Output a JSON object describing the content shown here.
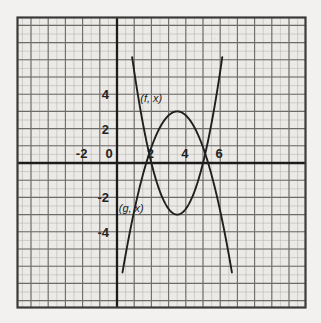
{
  "figure": {
    "title": "",
    "background_color": "#f2f1ef",
    "plot_background_color": "#eceae7",
    "frame_color": "#3a3a3a",
    "minor_grid_color": "#b9b7b4",
    "major_grid_color": "#6e6c6a",
    "axis_color": "#1c1c1c",
    "curve_color": "#1f1f1f"
  },
  "chart_data": {
    "type": "line",
    "title": "",
    "xlabel": "",
    "ylabel": "",
    "xlim": [
      -4.4,
      7.8
    ],
    "ylim": [
      -5.4,
      5.2
    ],
    "grid": true,
    "minor_grid_step": 0.5,
    "major_grid_step": 1,
    "legend_position": "inline-annotation",
    "xticks": [
      -2,
      0,
      2,
      4,
      6
    ],
    "xtick_labels": [
      "-2",
      "0",
      "2",
      "4",
      "6"
    ],
    "yticks": [
      -4,
      -2,
      2,
      4
    ],
    "ytick_labels": [
      "-4",
      "-2",
      "2",
      "4"
    ],
    "annotations": [
      {
        "text": "(f, x)",
        "x": 1.35,
        "y": 3.55
      },
      {
        "text": "(g, x)",
        "x": 0.1,
        "y": -2.85
      }
    ],
    "series": [
      {
        "name": "(f, x)",
        "label": "(f, x)",
        "type": "parabola-up",
        "description": "upward parabola with vertex near (3.5, -3), roots near x=2 and x=5",
        "vertex": [
          3.5,
          -3.0
        ],
        "roots": [
          2.0,
          5.0
        ],
        "points": [
          [
            1.0,
            3.1
          ],
          [
            1.2,
            2.3
          ],
          [
            1.4,
            1.6
          ],
          [
            1.6,
            0.9
          ],
          [
            1.8,
            0.3
          ],
          [
            2.0,
            -0.2
          ],
          [
            2.2,
            -0.8
          ],
          [
            2.4,
            -1.3
          ],
          [
            2.6,
            -1.7
          ],
          [
            2.8,
            -2.1
          ],
          [
            3.0,
            -2.5
          ],
          [
            3.2,
            -2.8
          ],
          [
            3.5,
            -3.0
          ],
          [
            3.8,
            -2.8
          ],
          [
            4.0,
            -2.5
          ],
          [
            4.2,
            -2.2
          ],
          [
            4.4,
            -1.8
          ],
          [
            4.6,
            -1.3
          ],
          [
            4.8,
            -0.8
          ],
          [
            5.0,
            -0.2
          ],
          [
            5.2,
            0.4
          ],
          [
            5.4,
            1.1
          ],
          [
            5.6,
            1.9
          ],
          [
            5.8,
            2.8
          ],
          [
            6.0,
            3.7
          ],
          [
            6.2,
            4.8
          ]
        ]
      },
      {
        "name": "(g, x)",
        "label": "(g, x)",
        "type": "parabola-down",
        "description": "downward parabola with vertex near (3.5, 3), roots near x=1.8 and x=5.3",
        "vertex": [
          3.5,
          3.0
        ],
        "roots": [
          1.8,
          5.3
        ],
        "points": [
          [
            1.0,
            -4.9
          ],
          [
            1.2,
            -3.9
          ],
          [
            1.4,
            -2.9
          ],
          [
            1.6,
            -1.9
          ],
          [
            1.8,
            -0.9
          ],
          [
            2.0,
            0.0
          ],
          [
            2.2,
            0.8
          ],
          [
            2.4,
            1.4
          ],
          [
            2.6,
            1.9
          ],
          [
            2.8,
            2.3
          ],
          [
            3.0,
            2.6
          ],
          [
            3.2,
            2.9
          ],
          [
            3.5,
            3.0
          ],
          [
            3.8,
            2.9
          ],
          [
            4.0,
            2.7
          ],
          [
            4.2,
            2.3
          ],
          [
            4.4,
            1.9
          ],
          [
            4.6,
            1.4
          ],
          [
            4.8,
            0.8
          ],
          [
            5.0,
            0.0
          ],
          [
            5.2,
            -0.9
          ],
          [
            5.4,
            -1.9
          ],
          [
            5.6,
            -2.9
          ],
          [
            5.8,
            -3.9
          ],
          [
            6.0,
            -4.9
          ]
        ]
      }
    ],
    "intersections": [
      {
        "x": 2.05,
        "y": -0.45
      },
      {
        "x": 4.95,
        "y": -0.45
      }
    ]
  }
}
